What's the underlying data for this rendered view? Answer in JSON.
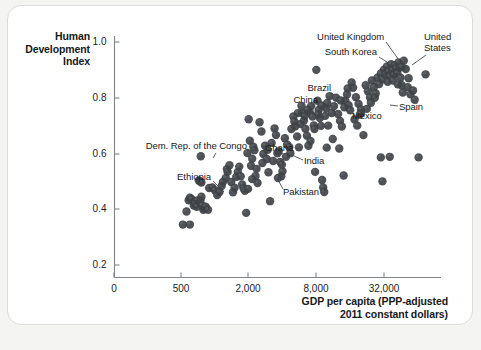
{
  "figure": {
    "background_color": "#ffffff",
    "page_color": "#f4f4f2",
    "card_border_color": "#dcdcdc",
    "dot_color": "#3f4246",
    "axis_color": "#808488"
  },
  "axes": {
    "y_title_lines": [
      "Human",
      "Development",
      "Index"
    ],
    "x_title_lines": [
      "GDP per capita (PPP-adjusted",
      "2011 constant dollars)"
    ]
  },
  "chart_data": {
    "type": "scatter",
    "title": "",
    "subtitle": "",
    "xlabel": "GDP per capita (PPP-adjusted 2011 constant dollars)",
    "ylabel": "Human Development Index",
    "xscale": "log",
    "yscale": "linear",
    "grid": false,
    "legend": "none",
    "xlim": [
      330,
      90000
    ],
    "ylim": [
      0.2,
      1.0
    ],
    "xticks": [
      {
        "label": "0",
        "value": 0,
        "px": 114
      },
      {
        "label": "500",
        "value": 500,
        "px": 181
      },
      {
        "label": "2,000",
        "value": 2000,
        "px": 248
      },
      {
        "label": "8,000",
        "value": 8000,
        "px": 316
      },
      {
        "label": "32,000",
        "value": 32000,
        "px": 384
      }
    ],
    "yticks": [
      {
        "label": "1.0",
        "value": 1.0,
        "px": 42
      },
      {
        "label": "0.8",
        "value": 0.8,
        "px": 98
      },
      {
        "label": "0.6",
        "value": 0.6,
        "px": 154
      },
      {
        "label": "0.4",
        "value": 0.4,
        "px": 209
      },
      {
        "label": "0.2",
        "value": 0.2,
        "px": 265
      }
    ],
    "marker": {
      "shape": "circle",
      "radius_px": 4.2,
      "color": "#3f4246",
      "opacity": 0.92
    },
    "annotations": [
      {
        "text": "United Kingdom",
        "label_x": 384,
        "label_y": 37,
        "align": "right",
        "leader": [
          386,
          42,
          401,
          63
        ]
      },
      {
        "text": "South Korea",
        "label_x": 377,
        "label_y": 52,
        "align": "right",
        "leader": [
          379,
          57,
          398,
          69
        ]
      },
      {
        "text": "United\nStates",
        "label_x": 424,
        "label_y": 37,
        "align": "left",
        "leader": [
          426,
          55,
          412,
          65
        ]
      },
      {
        "text": "Brazil",
        "label_x": 331,
        "label_y": 88,
        "align": "right",
        "leader": [
          332,
          93,
          342,
          104
        ]
      },
      {
        "text": "China",
        "label_x": 318,
        "label_y": 100,
        "align": "right",
        "leader": [
          320,
          105,
          338,
          113
        ]
      },
      {
        "text": "Mexico",
        "label_x": 352,
        "label_y": 116,
        "align": "left",
        "leader": [
          351,
          114,
          344,
          108
        ]
      },
      {
        "text": "Spain",
        "label_x": 399,
        "label_y": 107,
        "align": "left",
        "leader": [
          398,
          106,
          390,
          105
        ]
      },
      {
        "text": "Dem. Rep. of the Congo",
        "label_x": 247,
        "label_y": 146,
        "align": "right",
        "leader": [
          216,
          153,
          213,
          158
        ]
      },
      {
        "text": "Ghana",
        "label_x": 265,
        "label_y": 148,
        "align": "left",
        "leader": [
          281,
          153,
          290,
          157
        ]
      },
      {
        "text": "India",
        "label_x": 304,
        "label_y": 161,
        "align": "left",
        "leader": [
          303,
          160,
          292,
          155
        ]
      },
      {
        "text": "Ethiopia",
        "label_x": 211,
        "label_y": 177,
        "align": "right",
        "leader": [
          213,
          181,
          224,
          192
        ]
      },
      {
        "text": "Pakistan",
        "label_x": 283,
        "label_y": 192,
        "align": "left",
        "leader": [
          283,
          189,
          277,
          178
        ]
      }
    ],
    "points": [
      [
        520,
        0.345
      ],
      [
        560,
        0.392
      ],
      [
        600,
        0.345
      ],
      [
        585,
        0.432
      ],
      [
        600,
        0.441
      ],
      [
        620,
        0.437
      ],
      [
        650,
        0.413
      ],
      [
        665,
        0.421
      ],
      [
        690,
        0.409
      ],
      [
        700,
        0.432
      ],
      [
        720,
        0.503
      ],
      [
        740,
        0.5
      ],
      [
        760,
        0.496
      ],
      [
        745,
        0.432
      ],
      [
        760,
        0.445
      ],
      [
        790,
        0.398
      ],
      [
        800,
        0.404
      ],
      [
        770,
        0.414
      ],
      [
        830,
        0.409
      ],
      [
        870,
        0.398
      ],
      [
        750,
        0.59
      ],
      [
        890,
        0.476
      ],
      [
        950,
        0.478
      ],
      [
        1000,
        0.468
      ],
      [
        1050,
        0.451
      ],
      [
        1100,
        0.462
      ],
      [
        1150,
        0.483
      ],
      [
        1180,
        0.498
      ],
      [
        1250,
        0.512
      ],
      [
        1280,
        0.544
      ],
      [
        1300,
        0.534
      ],
      [
        1350,
        0.558
      ],
      [
        1400,
        0.498
      ],
      [
        1450,
        0.461
      ],
      [
        1500,
        0.477
      ],
      [
        1550,
        0.516
      ],
      [
        1600,
        0.534
      ],
      [
        1650,
        0.553
      ],
      [
        1700,
        0.518
      ],
      [
        1750,
        0.489
      ],
      [
        1800,
        0.475
      ],
      [
        1850,
        0.466
      ],
      [
        1900,
        0.387
      ],
      [
        1950,
        0.602
      ],
      [
        2000,
        0.723
      ],
      [
        2050,
        0.646
      ],
      [
        2100,
        0.556
      ],
      [
        2150,
        0.581
      ],
      [
        2200,
        0.624
      ],
      [
        2250,
        0.612
      ],
      [
        2300,
        0.519
      ],
      [
        2400,
        0.494
      ],
      [
        2500,
        0.712
      ],
      [
        2600,
        0.679
      ],
      [
        2700,
        0.598
      ],
      [
        2800,
        0.628
      ],
      [
        2900,
        0.58
      ],
      [
        3000,
        0.533
      ],
      [
        3100,
        0.429
      ],
      [
        3200,
        0.638
      ],
      [
        3400,
        0.69
      ],
      [
        3500,
        0.666
      ],
      [
        3600,
        0.601
      ],
      [
        3700,
        0.608
      ],
      [
        3800,
        0.57
      ],
      [
        3900,
        0.518
      ],
      [
        4000,
        0.536
      ],
      [
        4200,
        0.655
      ],
      [
        4400,
        0.632
      ],
      [
        4600,
        0.623
      ],
      [
        4800,
        0.688
      ],
      [
        5000,
        0.733
      ],
      [
        5200,
        0.698
      ],
      [
        5400,
        0.661
      ],
      [
        5600,
        0.622
      ],
      [
        5800,
        0.706
      ],
      [
        6000,
        0.746
      ],
      [
        6200,
        0.718
      ],
      [
        6400,
        0.689
      ],
      [
        6600,
        0.664
      ],
      [
        6800,
        0.628
      ],
      [
        7000,
        0.748
      ],
      [
        7200,
        0.77
      ],
      [
        7400,
        0.733
      ],
      [
        7600,
        0.701
      ],
      [
        7800,
        0.534
      ],
      [
        8000,
        0.9
      ],
      [
        8200,
        0.789
      ],
      [
        8400,
        0.756
      ],
      [
        8600,
        0.727
      ],
      [
        8800,
        0.699
      ],
      [
        9000,
        0.505
      ],
      [
        9200,
        0.478
      ],
      [
        9400,
        0.462
      ],
      [
        9600,
        0.735
      ],
      [
        9800,
        0.762
      ],
      [
        10000,
        0.781
      ],
      [
        10500,
        0.806
      ],
      [
        11000,
        0.745
      ],
      [
        11500,
        0.77
      ],
      [
        12000,
        0.8
      ],
      [
        12500,
        0.742
      ],
      [
        13000,
        0.717
      ],
      [
        13500,
        0.697
      ],
      [
        14000,
        0.521
      ],
      [
        14500,
        0.789
      ],
      [
        15000,
        0.812
      ],
      [
        15500,
        0.773
      ],
      [
        16000,
        0.755
      ],
      [
        17000,
        0.836
      ],
      [
        18000,
        0.802
      ],
      [
        19000,
        0.778
      ],
      [
        20000,
        0.758
      ],
      [
        21000,
        0.666
      ],
      [
        22000,
        0.845
      ],
      [
        23000,
        0.823
      ],
      [
        24000,
        0.801
      ],
      [
        25000,
        0.862
      ],
      [
        26000,
        0.838
      ],
      [
        27000,
        0.815
      ],
      [
        28000,
        0.872
      ],
      [
        29000,
        0.849
      ],
      [
        30000,
        0.887
      ],
      [
        31000,
        0.866
      ],
      [
        32000,
        0.901
      ],
      [
        33000,
        0.884
      ],
      [
        34000,
        0.912
      ],
      [
        35000,
        0.893
      ],
      [
        36000,
        0.876
      ],
      [
        37000,
        0.92
      ],
      [
        38000,
        0.899
      ],
      [
        39000,
        0.882
      ],
      [
        40000,
        0.917
      ],
      [
        41000,
        0.905
      ],
      [
        42000,
        0.888
      ],
      [
        43000,
        0.927
      ],
      [
        44000,
        0.908
      ],
      [
        45000,
        0.872
      ],
      [
        46000,
        0.845
      ],
      [
        47000,
        0.819
      ],
      [
        48000,
        0.933
      ],
      [
        50000,
        0.903
      ],
      [
        52000,
        0.838
      ],
      [
        55000,
        0.812
      ],
      [
        58000,
        0.826
      ],
      [
        60000,
        0.793
      ],
      [
        65000,
        0.586
      ],
      [
        30000,
        0.586
      ],
      [
        36000,
        0.588
      ],
      [
        31000,
        0.5
      ],
      [
        75000,
        0.884
      ],
      [
        20000,
        0.745
      ],
      [
        18500,
        0.7
      ],
      [
        12800,
        0.618
      ],
      [
        11200,
        0.652
      ],
      [
        9900,
        0.621
      ],
      [
        8900,
        0.772
      ],
      [
        8300,
        0.741
      ],
      [
        7700,
        0.688
      ],
      [
        7100,
        0.645
      ],
      [
        6700,
        0.757
      ],
      [
        6300,
        0.734
      ],
      [
        5900,
        0.771
      ],
      [
        5500,
        0.745
      ],
      [
        5100,
        0.715
      ],
      [
        4700,
        0.601
      ],
      [
        4300,
        0.588
      ],
      [
        3950,
        0.56
      ],
      [
        3650,
        0.512
      ],
      [
        3300,
        0.573
      ],
      [
        2950,
        0.613
      ],
      [
        2650,
        0.566
      ],
      [
        2350,
        0.545
      ],
      [
        2150,
        0.508
      ],
      [
        1975,
        0.473
      ],
      [
        26500,
        0.8
      ],
      [
        24500,
        0.782
      ],
      [
        22500,
        0.76
      ],
      [
        19500,
        0.74
      ],
      [
        17500,
        0.722
      ],
      [
        16500,
        0.855
      ],
      [
        15200,
        0.833
      ],
      [
        14200,
        0.766
      ],
      [
        13200,
        0.79
      ],
      [
        10200,
        0.7
      ],
      [
        34500,
        0.857
      ],
      [
        38500,
        0.862
      ],
      [
        42500,
        0.848
      ],
      [
        46000,
        0.91
      ],
      [
        53000,
        0.87
      ]
    ]
  }
}
